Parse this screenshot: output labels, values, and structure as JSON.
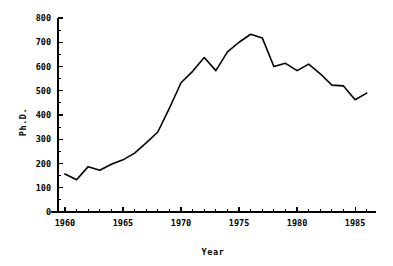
{
  "chart_data": {
    "type": "line",
    "title": "",
    "subtitle": "",
    "xlabel": "Year",
    "ylabel": "Ph.D.",
    "xlim": [
      1959.4,
      1986.8
    ],
    "ylim": [
      0,
      800
    ],
    "grid": false,
    "legend": null,
    "x_ticks_major": [
      1960,
      1965,
      1970,
      1975,
      1980,
      1985
    ],
    "x_tick_labels": [
      "1960",
      "1965",
      "1970",
      "1975",
      "1980",
      "1985"
    ],
    "x_ticks_minor_step": 1,
    "y_ticks_major": [
      0,
      100,
      200,
      300,
      400,
      500,
      600,
      700,
      800
    ],
    "y_tick_labels": [
      "0",
      "100",
      "200",
      "300",
      "400",
      "500",
      "600",
      "700",
      "800"
    ],
    "y_ticks_minor_step": 50,
    "series": [
      {
        "name": "Ph.D. degrees awarded",
        "color": "#000000",
        "x": [
          1960,
          1961,
          1962,
          1963,
          1964,
          1965,
          1966,
          1967,
          1968,
          1969,
          1970,
          1971,
          1972,
          1973,
          1974,
          1975,
          1976,
          1977,
          1978,
          1979,
          1980,
          1981,
          1982,
          1983,
          1984,
          1985,
          1986
        ],
        "values": [
          157,
          133,
          187,
          172,
          197,
          215,
          243,
          285,
          330,
          428,
          533,
          580,
          637,
          583,
          660,
          700,
          733,
          718,
          600,
          613,
          583,
          610,
          570,
          523,
          520,
          463,
          490
        ]
      }
    ]
  },
  "axes": {
    "x_title": "Year",
    "y_title": "Ph.D."
  }
}
